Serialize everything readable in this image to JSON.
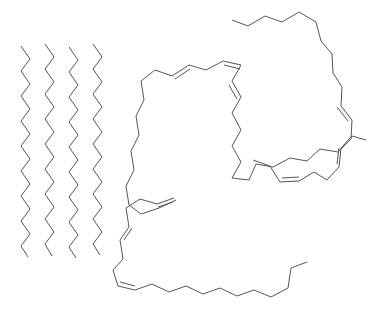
{
  "figure": {
    "background_color": "#ffffff",
    "stroke_color": "#555555",
    "stroke_width": 1,
    "width": 379,
    "height": 313,
    "labels_visible": false
  },
  "molecules": [
    {
      "id": "saturated-chain-1",
      "name": "saturated-fatty-acid-chain-1",
      "kind": "saturated",
      "double_bonds": 0,
      "orientation": "vertical",
      "points": "21,46 30,59 21,71 30,84 21,96 30,109 21,121 30,134 21,146 30,159 21,171 30,184 21,196 30,209 21,221 30,234 21,246 28,257"
    },
    {
      "id": "saturated-chain-2",
      "name": "saturated-fatty-acid-chain-2",
      "kind": "saturated",
      "double_bonds": 0,
      "orientation": "vertical",
      "points": "45,44 54,57 45,69 54,82 45,94 54,107 45,119 54,132 45,144 54,157 45,169 54,182 45,194 54,207 45,219 54,232 45,244 52,256"
    },
    {
      "id": "saturated-chain-3",
      "name": "saturated-fatty-acid-chain-3",
      "kind": "saturated",
      "double_bonds": 0,
      "orientation": "vertical",
      "points": "69,47 78,60 69,72 78,85 69,97 78,110 69,122 78,135 69,147 78,160 69,172 78,185 69,197 78,210 69,222 78,235 69,247 76,258"
    },
    {
      "id": "saturated-chain-4",
      "name": "saturated-fatty-acid-chain-4",
      "kind": "saturated",
      "double_bonds": 0,
      "orientation": "vertical",
      "points": "93,44 102,57 93,69 102,82 93,94 102,107 93,119 102,132 93,144 102,157 93,169 102,182 93,194 102,207 93,219 102,232 93,244 100,255"
    },
    {
      "id": "polyunsaturated-large",
      "name": "polyunsaturated-fatty-acid-large",
      "kind": "polyunsaturated",
      "double_bonds": 4,
      "orientation": "ring-like-loop",
      "points": "232,20 248,26 265,16 282,22 299,12 316,22 321,41 332,54 333,73 342,87 341,106 352,120 351,139 338,152 320,149 307,161 290,158 273,167 256,164 249,180 232,178 241,162 232,146 241,130 232,113 241,97 232,81 241,65 223,61 206,70 189,65 172,76 155,70 141,81 144,100 136,116 139,135 131,151 134,170 126,186 129,205 141,214 159,208 176,200",
      "double_bond_segments": [
        {
          "from": "241,97",
          "to": "232,81",
          "label": "cis-double-bond-1"
        },
        {
          "from": "241,65",
          "to": "223,61",
          "label": "cis-double-bond-2"
        },
        {
          "from": "189,65",
          "to": "172,76",
          "label": "cis-double-bond-3"
        },
        {
          "from": "341,106",
          "to": "352,120",
          "label": "cis-double-bond-4"
        }
      ]
    },
    {
      "id": "polyunsaturated-middle-right",
      "name": "polyunsaturated-fatty-acid-middle-right",
      "kind": "polyunsaturated",
      "double_bonds": 2,
      "orientation": "horizontal-wave",
      "points": "253,160 270,166 280,182 299,181 314,172 327,180 339,167 341,148 352,136 366,140"
    },
    {
      "id": "polyunsaturated-bottom",
      "name": "polyunsaturated-fatty-acid-bottom",
      "kind": "polyunsaturated",
      "double_bonds": 3,
      "orientation": "horizontal-long",
      "points": "174,198 157,204 140,199 126,208 129,227 120,240 123,259 113,270 118,286 135,290 152,284 169,292 186,286 203,294 220,288 237,296 254,290 271,297 288,288 291,268 307,262"
    }
  ],
  "bond_style": {
    "single_bond": "single line",
    "double_bond": "two parallel lines (cis configuration)",
    "double_bond_offset_px": 3
  }
}
